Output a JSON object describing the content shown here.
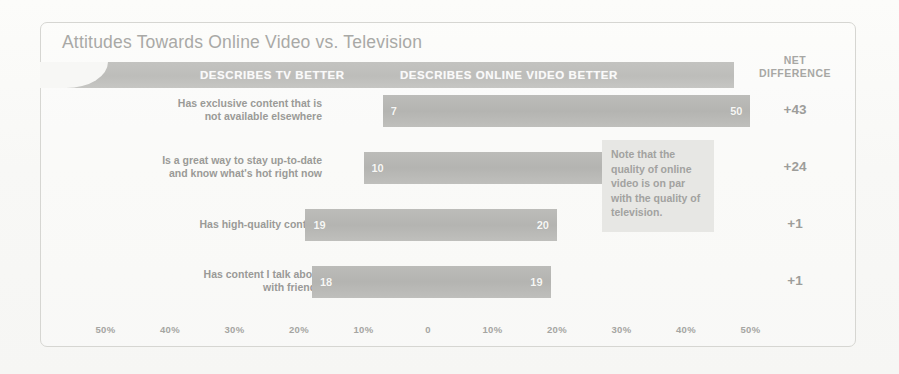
{
  "title": "Attitudes Towards Online Video vs. Television",
  "band": {
    "tv_label": "DESCRIBES TV BETTER",
    "online_label": "DESCRIBES ONLINE VIDEO BETTER"
  },
  "netdiff_header": "NET DIFFERENCE",
  "note": "Note that the quality of online video is on par with the quality of television.",
  "colors": {
    "bar": "#b8b8b5",
    "band": "#c1c1be",
    "note_bg": "#e7e7e4",
    "text": "#9a9a97",
    "frame": "#d6d6d2",
    "paper": "#f9f9f7"
  },
  "chart_data": {
    "type": "bar",
    "title": "Attitudes Towards Online Video vs. Television",
    "subtype": "diverging-horizontal-bar",
    "xlabel": "",
    "ylabel": "",
    "xlim": [
      -50,
      50
    ],
    "grid": false,
    "legend_position": "top-band",
    "axis_ticks": [
      {
        "label": "50%",
        "value": -50
      },
      {
        "label": "40%",
        "value": -40
      },
      {
        "label": "30%",
        "value": -30
      },
      {
        "label": "20%",
        "value": -20
      },
      {
        "label": "10%",
        "value": -10
      },
      {
        "label": "0",
        "value": 0
      },
      {
        "label": "10%",
        "value": 10
      },
      {
        "label": "20%",
        "value": 20
      },
      {
        "label": "30%",
        "value": 30
      },
      {
        "label": "40%",
        "value": 40
      },
      {
        "label": "50%",
        "value": 50
      }
    ],
    "categories": [
      "Has exclusive content that is not available elsewhere",
      "Is a great way to stay up-to-date and know what's hot right now",
      "Has high-quality content",
      "Has content I talk about with friends"
    ],
    "series": [
      {
        "name": "DESCRIBES TV BETTER",
        "values": [
          7,
          10,
          19,
          18
        ]
      },
      {
        "name": "DESCRIBES ONLINE VIDEO BETTER",
        "values": [
          50,
          34,
          20,
          19
        ]
      }
    ],
    "net_difference": [
      "+43",
      "+24",
      "+1",
      "+1"
    ],
    "annotations": [
      "Note that the quality of online video is on par with the quality of television."
    ]
  },
  "rows": [
    {
      "label_line1": "Has exclusive content that is",
      "label_line2": "not available elsewhere",
      "tv": "7",
      "online": "50",
      "net": "+43"
    },
    {
      "label_line1": "Is a great way to stay up-to-date",
      "label_line2": "and know what's hot right now",
      "tv": "10",
      "online": "34",
      "net": "+24"
    },
    {
      "label_line1": "Has high-quality content",
      "label_line2": "",
      "tv": "19",
      "online": "20",
      "net": "+1"
    },
    {
      "label_line1": "Has content I talk about",
      "label_line2": "with friends",
      "tv": "18",
      "online": "19",
      "net": "+1"
    }
  ]
}
